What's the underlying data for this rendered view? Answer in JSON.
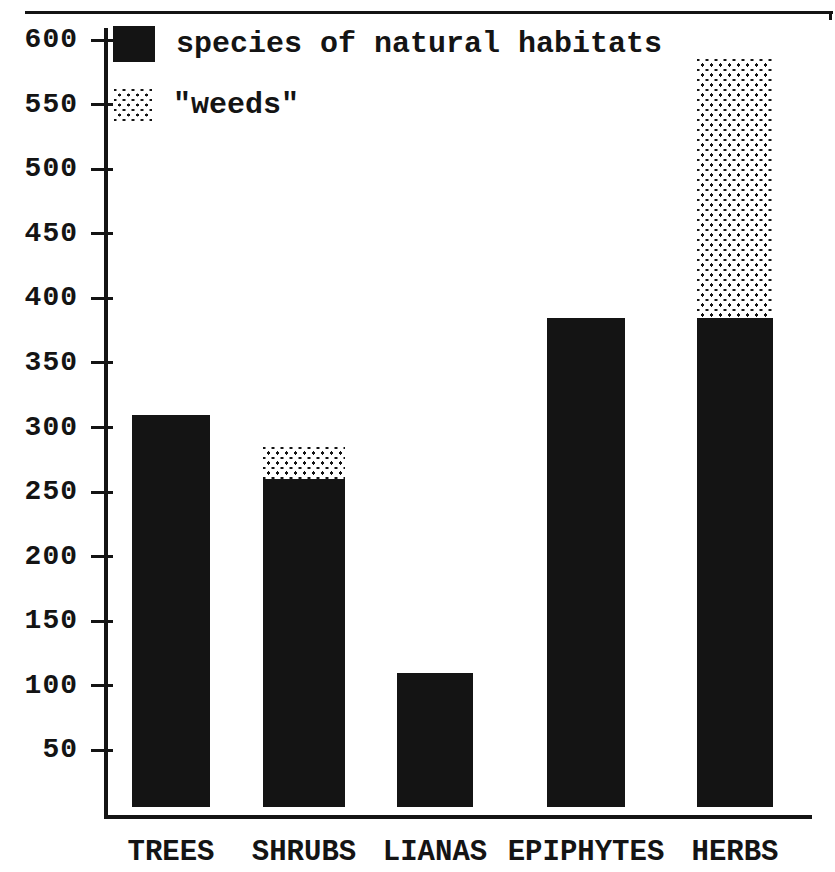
{
  "figure": {
    "background_color": "#ffffff",
    "ink_color": "#141414"
  },
  "chart_data": {
    "type": "bar",
    "stacked": true,
    "title": "",
    "xlabel": "",
    "ylabel": "",
    "categories": [
      "TREES",
      "SHRUBS",
      "LIANAS",
      "EPIPHYTES",
      "HERBS"
    ],
    "series": [
      {
        "name": "species of natural habitats",
        "style": "solid",
        "values": [
          310,
          260,
          110,
          385,
          385
        ]
      },
      {
        "name": "\"weeds\"",
        "style": "stippled",
        "values": [
          0,
          25,
          0,
          0,
          200
        ]
      }
    ],
    "stack_totals": [
      310,
      285,
      110,
      385,
      585
    ],
    "ylim": [
      0,
      620
    ],
    "yticks": [
      50,
      100,
      150,
      200,
      250,
      300,
      350,
      400,
      450,
      500,
      550,
      600
    ],
    "grid": false,
    "legend_position": "top-left"
  }
}
